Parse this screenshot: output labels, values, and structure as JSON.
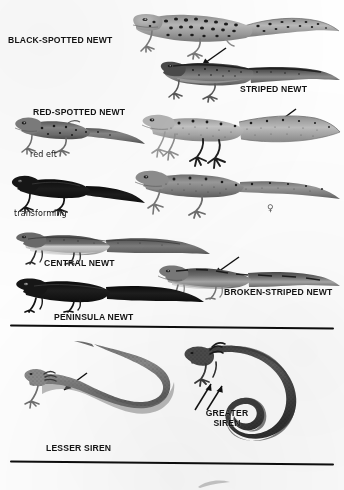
{
  "plate": {
    "kind": "field-guide-plate",
    "subject": "newts-and-sirens",
    "width": 344,
    "height": 490,
    "background_color": "#fefefe",
    "ink_color": "#131313"
  },
  "sections": [
    {
      "name": "newts",
      "divider_label": ""
    },
    {
      "name": "sirens",
      "divider_label": ""
    }
  ],
  "labels": {
    "black_spotted_newt": "BLACK-SPOTTED NEWT",
    "striped_newt": "STRIPED NEWT",
    "red_spotted_newt": "RED-SPOTTED NEWT",
    "red_eft": "red eft",
    "transforming": "transforming",
    "central_newt": "CENTRAL NEWT",
    "broken_striped_newt": "BROKEN-STRIPED NEWT",
    "peninsula_newt": "PENINSULA NEWT",
    "lesser_siren": "LESSER SIREN",
    "greater_siren_line1": "GREATER",
    "greater_siren_line2": "SIREN",
    "female_symbol": "♀"
  },
  "figures": [
    {
      "id": "black-spotted-newt",
      "label": "BLACK-SPOTTED NEWT",
      "pose": "walking-left-facing",
      "tone": "light-gray",
      "markings": "large black spots",
      "has_limbs": true
    },
    {
      "id": "striped-newt",
      "label": "STRIPED NEWT",
      "pose": "walking-left-facing",
      "tone": "dark-gray",
      "markings": "dorsal stripe",
      "has_limbs": true
    },
    {
      "id": "red-spotted-newt-eft",
      "label": "red eft",
      "pose": "walking-left-facing",
      "tone": "mid-gray",
      "markings": "scattered spots",
      "has_limbs": true
    },
    {
      "id": "red-spotted-newt-adult-upper",
      "label": "RED-SPOTTED NEWT",
      "pose": "swimming-left-facing",
      "tone": "light-gray",
      "markings": "fine speckles, keeled tail",
      "has_limbs": true
    },
    {
      "id": "red-spotted-newt-transforming",
      "label": "transforming",
      "pose": "walking-left-facing",
      "tone": "black",
      "markings": "silhouette",
      "has_limbs": true
    },
    {
      "id": "red-spotted-newt-female",
      "label": "♀",
      "pose": "walking-left-facing",
      "tone": "mid-gray",
      "markings": "dense speckles",
      "has_limbs": true
    },
    {
      "id": "central-newt",
      "label": "CENTRAL NEWT",
      "pose": "walking-left-facing",
      "tone": "two-tone",
      "markings": "dark dorsum, pale belly",
      "has_limbs": true
    },
    {
      "id": "broken-striped-newt",
      "label": "BROKEN-STRIPED NEWT",
      "pose": "walking-left-facing",
      "tone": "mid-dark-gray",
      "markings": "broken dorsal stripe",
      "has_limbs": true
    },
    {
      "id": "peninsula-newt",
      "label": "PENINSULA NEWT",
      "pose": "walking-left-facing",
      "tone": "black",
      "markings": "silhouette",
      "has_limbs": true
    },
    {
      "id": "lesser-siren",
      "label": "LESSER SIREN",
      "pose": "s-curved-eel-like",
      "tone": "mid-gray-stippled",
      "markings": "uniform stipple",
      "has_limbs": true
    },
    {
      "id": "greater-siren",
      "label": "GREATER SIREN",
      "pose": "hooked-eel-like",
      "tone": "dark-gray-stippled",
      "markings": "uniform stipple",
      "has_limbs": true
    }
  ],
  "pointers": [
    {
      "id": "striped-newt-pointer",
      "points_to": "striped-newt",
      "direction": "down-left"
    },
    {
      "id": "red-spotted-newt-pointer",
      "points_to": "red-spotted-newt-adult-upper",
      "direction": "down-right"
    },
    {
      "id": "broken-striped-newt-pointer",
      "points_to": "broken-striped-newt",
      "direction": "down-right"
    },
    {
      "id": "lesser-siren-pointer",
      "points_to": "lesser-siren",
      "direction": "down-left"
    },
    {
      "id": "greater-siren-pointer-front",
      "points_to": "greater-siren",
      "direction": "up-right"
    },
    {
      "id": "greater-siren-pointer-gill",
      "points_to": "greater-siren",
      "direction": "up-right"
    }
  ]
}
